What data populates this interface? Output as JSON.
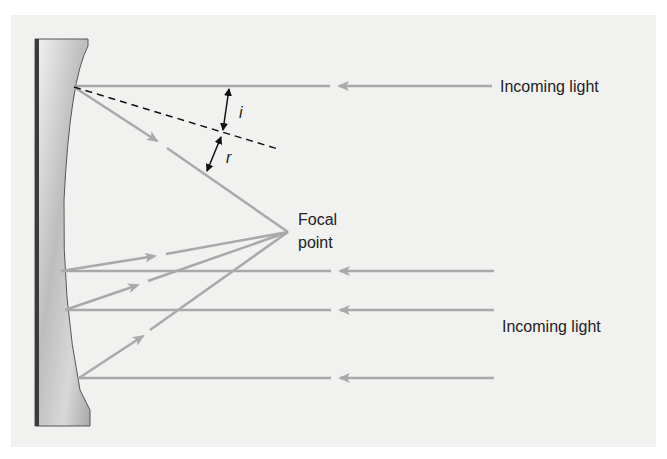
{
  "colors": {
    "background": "#ffffff",
    "panel": "#f1f1f0",
    "ray": "#a9a9a9",
    "mirror_back": "#3a3a3a",
    "mirror_outline": "#555555",
    "annotation": "#111111",
    "text": "#222222"
  },
  "labels": {
    "incoming_light_top": "Incoming light",
    "incoming_light_bottom": "Incoming light",
    "focal_line1": "Focal",
    "focal_line2": "point",
    "angle_incidence": "i",
    "angle_reflection": "r"
  },
  "geometry": {
    "focal_point": [
      288,
      232
    ],
    "incoming_rays_y": [
      86,
      271,
      310,
      378
    ],
    "mirror_hit_x": [
      74,
      61,
      65,
      79
    ]
  }
}
